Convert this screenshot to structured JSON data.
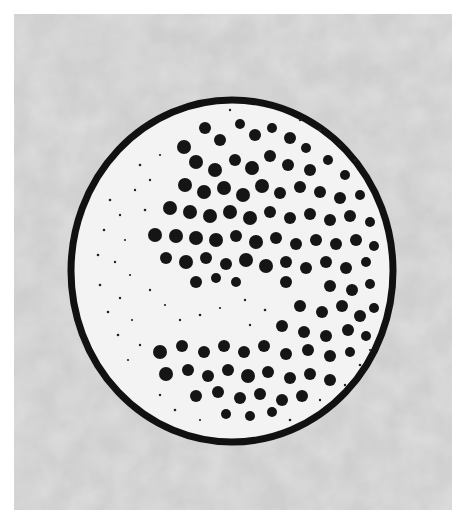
{
  "figure": {
    "colors": {
      "page": "#ffffff",
      "background": "#d2d2d2",
      "cell_fill": "#f2f2f2",
      "outline": "#111111",
      "granules": "#141414"
    }
  }
}
